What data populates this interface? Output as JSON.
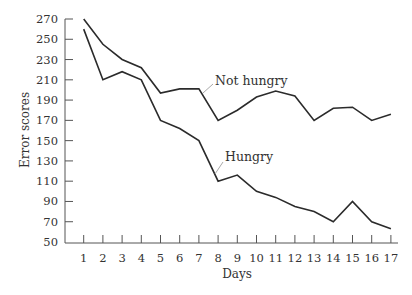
{
  "chart_data": {
    "type": "line",
    "title": "",
    "xlabel": "Days",
    "ylabel": "Error scores",
    "x": [
      1,
      2,
      3,
      4,
      5,
      6,
      7,
      8,
      9,
      10,
      11,
      12,
      13,
      14,
      15,
      16,
      17
    ],
    "xticks": [
      "1",
      "2",
      "3",
      "4",
      "5",
      "6",
      "7",
      "8",
      "9",
      "10",
      "11",
      "12",
      "13",
      "14",
      "15",
      "16",
      "17"
    ],
    "yticks": [
      50,
      70,
      90,
      110,
      130,
      150,
      170,
      190,
      210,
      230,
      250,
      270
    ],
    "ylim": [
      50,
      270
    ],
    "grid": false,
    "legend": "none (inline annotations)",
    "series": [
      {
        "name": "Not hungry",
        "values": [
          270,
          245,
          230,
          222,
          197,
          201,
          201,
          170,
          180,
          193,
          199,
          194,
          170,
          182,
          183,
          170,
          176
        ]
      },
      {
        "name": "Hungry",
        "values": [
          260,
          210,
          218,
          210,
          170,
          162,
          150,
          110,
          116,
          100,
          94,
          85,
          80,
          70,
          90,
          70,
          63
        ]
      }
    ],
    "annotations": [
      {
        "text": "Not hungry",
        "points_to_series": "Not hungry",
        "near_day": 7.5
      },
      {
        "text": "Hungry",
        "points_to_series": "Hungry",
        "near_day": 8
      }
    ]
  },
  "labels": {
    "not_hungry": "Not hungry",
    "hungry": "Hungry",
    "xlabel": "Days",
    "ylabel": "Error scores"
  },
  "colors": {
    "line": "#2b2b2b",
    "axis": "#555555",
    "leader": "#aaaaaa"
  }
}
